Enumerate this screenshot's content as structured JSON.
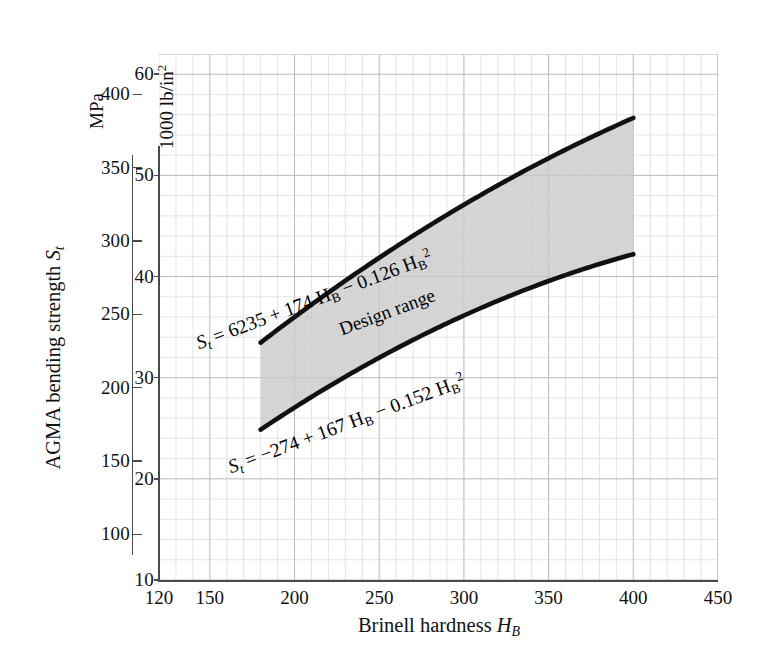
{
  "chart_data": {
    "type": "line",
    "title": "",
    "xlabel": "Brinell hardness  H_B",
    "ylabel": "AGMA bending strength S_t",
    "grid": true,
    "legend": "none",
    "x_axis": {
      "label": "Brinell hardness  H_B",
      "ticks": [
        120,
        150,
        200,
        250,
        300,
        350,
        400,
        450
      ],
      "tick_labels": [
        "120",
        "150",
        "200",
        "250",
        "300",
        "350",
        "400",
        "450"
      ],
      "xlim": [
        120,
        450
      ],
      "minor_step": 10
    },
    "y_axis_primary": {
      "unit": "1000 lb/in2",
      "unit_display": "1000 lb/in",
      "unit_exponent": "2",
      "ticks": [
        10,
        20,
        30,
        40,
        50,
        60
      ],
      "tick_labels": [
        "10",
        "20",
        "30",
        "40",
        "50",
        "60"
      ],
      "ylim": [
        10,
        62
      ],
      "minor_step": 2
    },
    "y_axis_secondary": {
      "unit": "MPa",
      "ticks": [
        100,
        150,
        200,
        250,
        300,
        350,
        400
      ],
      "tick_labels": [
        "100",
        "150",
        "200",
        "250",
        "300",
        "350",
        "400"
      ],
      "ylim": [
        69,
        427
      ]
    },
    "series": [
      {
        "name": "upper-bound",
        "equation": "St = 6235 + 174 HB - 0.126 HB^2",
        "coefficients": [
          6235,
          174,
          -0.126
        ],
        "units": "psi",
        "x": [
          180,
          200,
          220,
          240,
          260,
          280,
          300,
          320,
          340,
          360,
          380,
          400
        ],
        "values_ksi": [
          33.47,
          36.0,
          38.4,
          40.7,
          42.9,
          45.0,
          47.0,
          48.9,
          50.7,
          52.4,
          54.1,
          55.68
        ],
        "values_mpa": [
          231,
          248,
          265,
          281,
          296,
          310,
          324,
          337,
          350,
          361,
          373,
          384
        ]
      },
      {
        "name": "lower-bound",
        "equation": "St = -274 + 167 HB - 0.152 HB^2",
        "coefficients": [
          -274,
          167,
          -0.152
        ],
        "units": "psi",
        "x": [
          180,
          200,
          220,
          240,
          260,
          280,
          300,
          320,
          340,
          360,
          380,
          400
        ],
        "values_ksi": [
          24.86,
          27.0,
          29.1,
          30.9,
          32.6,
          34.3,
          35.8,
          37.2,
          38.5,
          39.7,
          40.8,
          42.21
        ],
        "values_mpa": [
          171,
          186,
          200,
          213,
          225,
          236,
          247,
          256,
          266,
          274,
          281,
          291
        ]
      }
    ],
    "shaded_region": {
      "label": "Design range",
      "between": [
        "upper-bound",
        "lower-bound"
      ],
      "x_from": 180,
      "x_to": 400,
      "fill_color": "#c9c9c9"
    },
    "annotations": [
      {
        "name": "upper-equation",
        "prefix": "S",
        "prefix_sub": "t",
        "body": " = 6235 + 174 H",
        "body_sub": "B",
        "tail": " − 0.126 H",
        "tail_sub": "B",
        "tail_sup": "2"
      },
      {
        "name": "lower-equation",
        "prefix": "S",
        "prefix_sub": "t",
        "body": " = −274 + 167 H",
        "body_sub": "B",
        "tail": " − 0.152 H",
        "tail_sub": "B",
        "tail_sup": "2"
      },
      {
        "name": "design-range-label",
        "text": "Design range"
      }
    ],
    "colors": {
      "curve": "#111111",
      "shade": "#c9c9c9",
      "grid_minor": "#d8d8dd",
      "grid_major": "#b9b9c2",
      "axis": "#4a4a4a",
      "text": "#111111"
    }
  },
  "axis_titles": {
    "y_main_pre": "AGMA bending strength ",
    "y_main_sym": "S",
    "y_main_sub": "t",
    "x_main_pre": "Brinell hardness  ",
    "x_main_sym": "H",
    "x_main_sub": "B"
  },
  "unit_captions": {
    "ksi_pre": "1000 lb/in",
    "ksi_sup": "2",
    "mpa": "MPa"
  },
  "ticks": {
    "ksi": [
      "60",
      "50",
      "40",
      "30",
      "20",
      "10"
    ],
    "mpa": [
      "400",
      "350",
      "300",
      "250",
      "200",
      "150",
      "100"
    ],
    "x": [
      "120",
      "150",
      "200",
      "250",
      "300",
      "350",
      "400",
      "450"
    ]
  },
  "labels": {
    "design_range": "Design range",
    "upper_eq_a": "S",
    "upper_eq_a_sub": "t",
    "upper_eq_b": " = 6235 + 174 H",
    "upper_eq_b_sub": "B",
    "upper_eq_c": " − 0.126 H",
    "upper_eq_c_sub": "B",
    "upper_eq_c_sup": "2",
    "lower_eq_a": "S",
    "lower_eq_a_sub": "t",
    "lower_eq_b": " = −274 + 167 H",
    "lower_eq_b_sub": "B",
    "lower_eq_c": " − 0.152 H",
    "lower_eq_c_sub": "B",
    "lower_eq_c_sup": "2"
  }
}
